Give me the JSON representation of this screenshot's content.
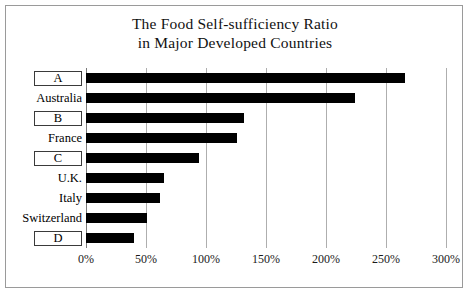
{
  "chart_data": {
    "type": "bar",
    "orientation": "horizontal",
    "title": "The Food Self-sufficiency Ratio in Major Developed Countries",
    "title_lines": [
      "The Food Self-sufficiency Ratio",
      "in Major Developed Countries"
    ],
    "categories": [
      "A",
      "Australia",
      "B",
      "France",
      "C",
      "U.K.",
      "Italy",
      "Switzerland",
      "D"
    ],
    "category_boxed": [
      true,
      false,
      true,
      false,
      true,
      false,
      false,
      false,
      true
    ],
    "values": [
      266,
      224,
      132,
      126,
      94,
      65,
      62,
      51,
      40
    ],
    "value_unit": "%",
    "xlabel": "",
    "ylabel": "",
    "xlim": [
      0,
      300
    ],
    "xticks": [
      0,
      50,
      100,
      150,
      200,
      250,
      300
    ],
    "xtick_labels": [
      "0%",
      "50%",
      "100%",
      "150%",
      "200%",
      "250%",
      "300%"
    ],
    "grid": "vertical",
    "legend": "none",
    "bar_color": "#000000",
    "grid_color": "#aeaeae",
    "frame_color": "#9a9a9a"
  }
}
